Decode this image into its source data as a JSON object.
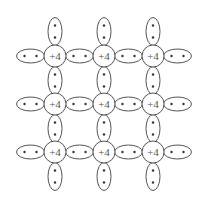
{
  "diagram": {
    "core_label": "+4",
    "grid": {
      "columns_x": [
        55,
        104,
        153
      ],
      "rows_y": [
        56,
        104,
        152
      ],
      "core_radius": 11
    },
    "bond": {
      "rx": 14,
      "ry": 7,
      "electrons_per_bond": 2
    },
    "colors": {
      "stroke": "#555555",
      "electron": "#333333",
      "text": "#555555",
      "background": "#ffffff"
    },
    "cores": [
      {
        "row": 0,
        "col": 0,
        "label": "+4"
      },
      {
        "row": 0,
        "col": 1,
        "label": "+4"
      },
      {
        "row": 0,
        "col": 2,
        "label": "+4"
      },
      {
        "row": 1,
        "col": 0,
        "label": "+4"
      },
      {
        "row": 1,
        "col": 1,
        "label": "+4"
      },
      {
        "row": 1,
        "col": 2,
        "label": "+4"
      },
      {
        "row": 2,
        "col": 0,
        "label": "+4"
      },
      {
        "row": 2,
        "col": 1,
        "label": "+4"
      },
      {
        "row": 2,
        "col": 2,
        "label": "+4"
      }
    ]
  }
}
